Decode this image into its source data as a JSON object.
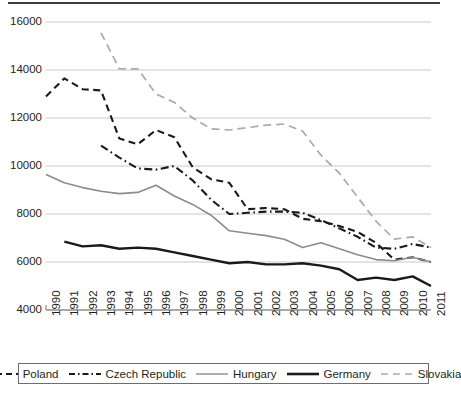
{
  "chart_data": {
    "type": "line",
    "title": "",
    "subtitle": "",
    "xlabel": "",
    "ylabel": "",
    "x": [
      1990,
      1991,
      1992,
      1993,
      1994,
      1995,
      1996,
      1997,
      1998,
      1999,
      2000,
      2001,
      2002,
      2003,
      2004,
      2005,
      2006,
      2007,
      2008,
      2009,
      2010,
      2011
    ],
    "xtick_labels": [
      "1990",
      "1991",
      "1992",
      "1993",
      "1994",
      "1995",
      "1996",
      "1997",
      "1998",
      "1999",
      "2000",
      "2001",
      "2002",
      "2003",
      "2004",
      "2005",
      "2006",
      "2007",
      "2008",
      "2009",
      "2010",
      "2011"
    ],
    "ytick_labels": [
      "4000",
      "6000",
      "8000",
      "10000",
      "12000",
      "14000",
      "16000"
    ],
    "ytick_values": [
      4000,
      6000,
      8000,
      10000,
      12000,
      14000,
      16000
    ],
    "ylim": [
      4000,
      16000
    ],
    "xlim": [
      1990,
      2011
    ],
    "grid": "horizontal",
    "legend_position": "bottom",
    "series": [
      {
        "name": "Poland",
        "style": "dashed",
        "color": "#1a1a1a",
        "width": 2.1,
        "values": [
          12900,
          13650,
          13200,
          13150,
          11150,
          10900,
          11500,
          11200,
          9950,
          9450,
          9300,
          8200,
          8250,
          8200,
          7800,
          7700,
          7500,
          7250,
          6800,
          6100,
          6200,
          6000
        ]
      },
      {
        "name": "Czech Republic",
        "style": "dash-dot",
        "color": "#1a1a1a",
        "width": 2.1,
        "values": [
          null,
          null,
          null,
          10850,
          10350,
          9900,
          9850,
          10000,
          9400,
          8600,
          8000,
          8050,
          8100,
          8100,
          8050,
          7750,
          7400,
          7050,
          6600,
          6550,
          6750,
          6600
        ]
      },
      {
        "name": "Hungary",
        "style": "solid",
        "color": "#8c8c8c",
        "width": 1.6,
        "values": [
          9650,
          9300,
          9100,
          8950,
          8850,
          8900,
          9200,
          8750,
          8400,
          7950,
          7300,
          7200,
          7100,
          6950,
          6600,
          6800,
          6550,
          6300,
          6100,
          6050,
          6200,
          6000
        ]
      },
      {
        "name": "Germany",
        "style": "solid",
        "color": "#1a1a1a",
        "width": 2.4,
        "values": [
          null,
          6850,
          6650,
          6700,
          6550,
          6600,
          6550,
          6400,
          6250,
          6100,
          5950,
          6000,
          5900,
          5900,
          5950,
          5850,
          5700,
          5250,
          5350,
          5250,
          5400,
          5000
        ]
      },
      {
        "name": "Slovakia",
        "style": "dashed-light",
        "color": "#aaaaaa",
        "width": 1.7,
        "values": [
          null,
          null,
          null,
          15550,
          14050,
          14050,
          13000,
          12650,
          12000,
          11550,
          11500,
          11600,
          11700,
          11750,
          11450,
          10450,
          9700,
          8700,
          7700,
          6950,
          7050,
          6600
        ]
      }
    ]
  },
  "legend": {
    "items": [
      {
        "label": "Poland",
        "style": "dashed",
        "color": "#1a1a1a"
      },
      {
        "label": "Czech Republic",
        "style": "dash-dot",
        "color": "#1a1a1a"
      },
      {
        "label": "Hungary",
        "style": "solid",
        "color": "#8c8c8c"
      },
      {
        "label": "Germany",
        "style": "solid-thick",
        "color": "#1a1a1a"
      },
      {
        "label": "Slovakia",
        "style": "dashed-light",
        "color": "#aaaaaa"
      }
    ]
  },
  "axis": {
    "gridline_color": "#c8c8c8",
    "axis_color": "#8c8c8c"
  }
}
